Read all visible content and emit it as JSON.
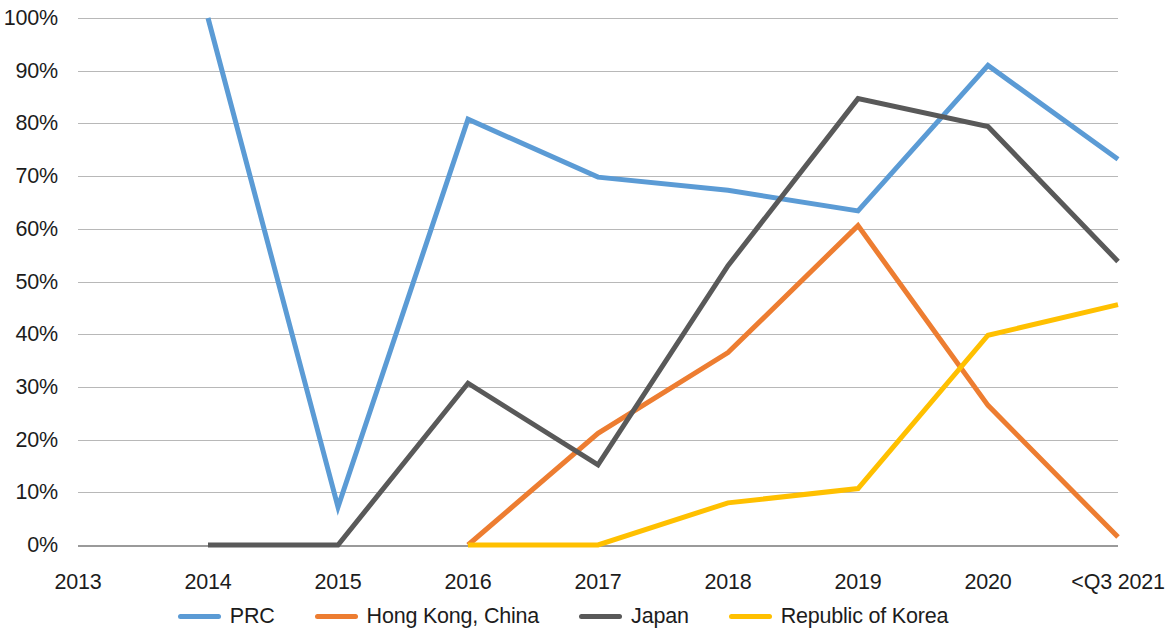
{
  "chart_data": {
    "type": "line",
    "title": "",
    "xlabel": "",
    "ylabel": "",
    "ylim": [
      0,
      100
    ],
    "ytick_labels": [
      "100%",
      "90%",
      "80%",
      "70%",
      "60%",
      "50%",
      "40%",
      "30%",
      "20%",
      "10%",
      "0%"
    ],
    "ytick_values": [
      100,
      90,
      80,
      70,
      60,
      50,
      40,
      30,
      20,
      10,
      0
    ],
    "grid": true,
    "legend_position": "bottom",
    "categories": [
      "2013",
      "2014",
      "2015",
      "2016",
      "2017",
      "2018",
      "2019",
      "2020",
      "<Q3 2021"
    ],
    "series": [
      {
        "name": "PRC",
        "color": "#5B9BD5",
        "values": [
          null,
          100,
          7.2,
          80.8,
          69.8,
          67.3,
          63.4,
          91.0,
          73.2
        ]
      },
      {
        "name": "Hong Kong, China",
        "color": "#ED7D31",
        "values": [
          null,
          null,
          null,
          0,
          21.2,
          36.5,
          60.6,
          26.5,
          1.5
        ]
      },
      {
        "name": "Japan",
        "color": "#595959",
        "values": [
          null,
          0,
          0,
          30.7,
          15.2,
          53.0,
          84.7,
          79.4,
          53.8
        ]
      },
      {
        "name": "Republic of Korea",
        "color": "#FFC000",
        "values": [
          null,
          null,
          null,
          0,
          0,
          8.0,
          10.7,
          39.8,
          45.6
        ]
      }
    ]
  },
  "legend": {
    "items": [
      {
        "label": "PRC",
        "color": "#5B9BD5",
        "swatch_name": "legend-swatch-prc"
      },
      {
        "label": "Hong Kong, China",
        "color": "#ED7D31",
        "swatch_name": "legend-swatch-hong-kong-china"
      },
      {
        "label": "Japan",
        "color": "#595959",
        "swatch_name": "legend-swatch-japan"
      },
      {
        "label": "Republic of Korea",
        "color": "#FFC000",
        "swatch_name": "legend-swatch-republic-of-korea"
      }
    ]
  }
}
